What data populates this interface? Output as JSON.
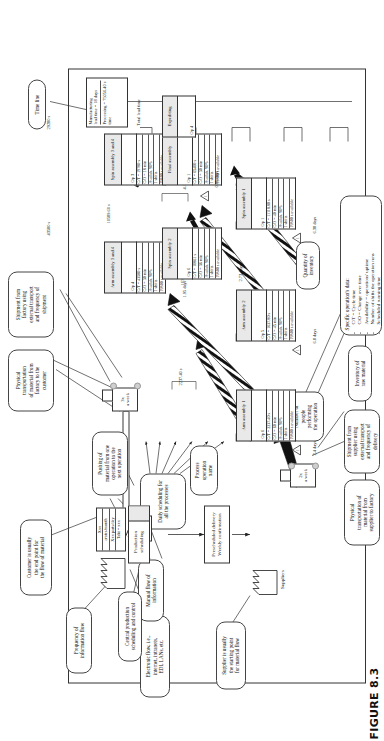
{
  "figure": {
    "caption": "FIGURE 8.3"
  },
  "callouts": {
    "supplier": "Supplier is usually\nthe starting point\nfor material flow",
    "central_scheduling": "Central production\nscheduling and control",
    "electronic_flow": "Electronic flow, i.e.,\ninternet, intranets,\nEDI, LANs, etc.",
    "manual_flow": "Manual flow of\ninformation",
    "frequency_info": "Frequency of\ninformation flow",
    "customer_endpoint": "Customer is usually\nthe end point for\nthe flow of material",
    "physical_transport_to_customer": "Physical\ntransportation\nof material from\nfactory to the\ncustomer",
    "shipment_from_factory": "Shipment from\nfactory using\nexternal transport\nand frequency of\nshipment",
    "time_line": "Time line",
    "physical_transport_from_supplier": "Physical\ntransportation of\nmaterial from\nsupplier to factory",
    "shipment_from_supplier": "Shipment from\nsupplier using\nexternal transport\nand frequency of\ndelivery",
    "inventory_raw": "Inventory of\nraw material",
    "process_operation_name": "Process\noperation\nname",
    "pushing_material": "Pushing of\nmaterial from one\noperation to the\nnext operation",
    "number_of_people": "Number of\npeople\nperforming\nthe operation",
    "quantity_inventory": "Quantity of\ninventory",
    "daily_scheduling": "Daily scheduling for\nall the processes",
    "specific_operation_title": "Specific operation's data:",
    "specific_operation_items": [
      "C/T = Cycle time",
      "C/O = Change over time",
      "Availability = operations' uptime",
      "Number of shifts the operation runs",
      "Scheduled running time"
    ]
  },
  "nodes": {
    "supplier": {
      "label": "Suppliers"
    },
    "customer_data": [
      "Xxx",
      "crates/month",
      "Xxx parts/day",
      "Takt = xxx"
    ],
    "production_scheduling": {
      "label": "Production\nscheduling"
    },
    "prescheduled_delivery": {
      "label": "Prescheduled delivery\nWeekly confirmation"
    },
    "inbound_truck": {
      "freq_top": "2x",
      "freq_bottom": "a week"
    },
    "outbound_truck": {
      "freq_top": "3x",
      "freq_bottom": "a week"
    },
    "frequency_tag": {
      "label": "Daily"
    }
  },
  "processes": [
    {
      "name": "Arm assembly 1",
      "operators": "Op 6",
      "data": [
        "C/T = 2237.40 s",
        "C/O = 60 min",
        "Availab. 90%",
        "1 shifts",
        "19800 s available"
      ],
      "cycle_time": "2237.40 s",
      "inventory_days": "2.4 days"
    },
    {
      "name": "Arm assembly 2",
      "operators": "Op 5",
      "data": [
        "C/T = 1637.80 s",
        "C/O = 45 min",
        "Availab. 90%",
        "1 shifts",
        "19800 s available"
      ],
      "cycle_time": "1637.80 s",
      "inventory_days": "6.8 days"
    },
    {
      "name": "Arm assembly 3 and 4",
      "operators": "Op 4",
      "data": [
        "C/T = 43580 s",
        "C/O = 30 min",
        "Availab. 90%",
        "1 shifts",
        "19800 s available"
      ],
      "cycle_time": "43580 s",
      "inventory_days": "1.95 days"
    },
    {
      "name": "Spin assembly 1",
      "operators": "Op 1",
      "data": [
        "C/T = 11118.80 s",
        "C/O = 40 min",
        "Availab. 90%",
        "1 shifts",
        "19800 s available"
      ],
      "cycle_time": "11118.80 s",
      "inventory_days": "6.38 days"
    },
    {
      "name": "Spin assembly 2",
      "operators": "Op 6",
      "data": [
        "C/T = 10861 s",
        "C/O = 36 min",
        "Availab. 90%",
        "1 shifts",
        "19800 s available"
      ],
      "cycle_time": "10589.60 s",
      "inventory_days": "2.73 days"
    },
    {
      "name": "Spin assembly 3 and 4",
      "operators": "Op 3",
      "data": [
        "C/T = 19780 s",
        "C/O = 18 min",
        "Availab. 90%",
        "1 shifts",
        "19800 s available"
      ],
      "cycle_time": "29280 s",
      "inventory_days": "4.13 days"
    },
    {
      "name": "Final assembly",
      "operators": "Op 1",
      "data": [
        "C/T = 65400 s",
        "C/O = 30 min",
        "Availab. 90%",
        "1 shifts",
        "19800 s available"
      ],
      "cycle_time": "65400 s",
      "inventory_days": "0.85 days"
    },
    {
      "name": "Expediting",
      "operators": "Op 4",
      "data": [],
      "cycle_time": "",
      "inventory_days": ""
    }
  ],
  "timeline": {
    "title_rows": [
      "Manufacturing\nlead time = 18 days",
      "Processing  = 75056.40 s\ntime"
    ],
    "total_lead_time_label": "Total lead time"
  }
}
